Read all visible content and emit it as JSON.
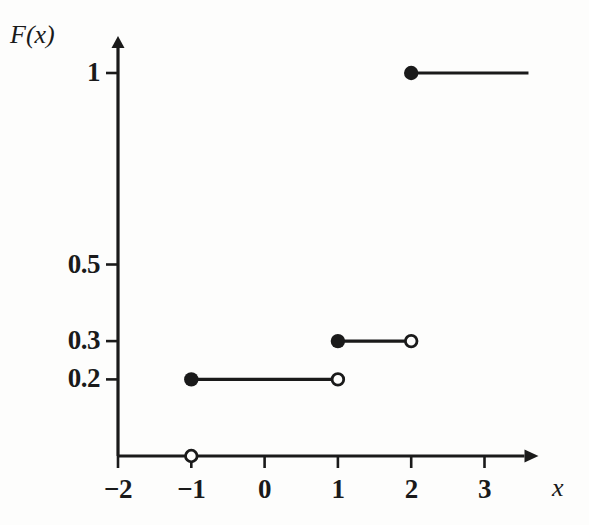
{
  "chart_data": {
    "type": "line",
    "title": "",
    "subtitle": "",
    "xlabel": "x",
    "ylabel": "F(x)",
    "grid": false,
    "legend": "none",
    "xlim": [
      -2,
      3.6
    ],
    "ylim": [
      0,
      1.12
    ],
    "x_ticks": [
      {
        "value": -2,
        "label": "−2"
      },
      {
        "value": -1,
        "label": "−1"
      },
      {
        "value": 0,
        "label": "0"
      },
      {
        "value": 1,
        "label": "1"
      },
      {
        "value": 2,
        "label": "2"
      },
      {
        "value": 3,
        "label": "3"
      }
    ],
    "y_ticks": [
      {
        "value": 0.2,
        "label": "0.2"
      },
      {
        "value": 0.3,
        "label": "0.3"
      },
      {
        "value": 0.5,
        "label": "0.5"
      },
      {
        "value": 1,
        "label": "1"
      }
    ],
    "series": [
      {
        "name": "F(x)",
        "steps": [
          {
            "y": 0,
            "x_start": -1,
            "x_end": -1,
            "start_marker": "open",
            "end_marker": "none",
            "draw_segment": false
          },
          {
            "y": 0.2,
            "x_start": -1,
            "x_end": 1,
            "start_marker": "filled",
            "end_marker": "open",
            "draw_segment": true
          },
          {
            "y": 0.3,
            "x_start": 1,
            "x_end": 2,
            "start_marker": "filled",
            "end_marker": "open",
            "draw_segment": true
          },
          {
            "y": 1,
            "x_start": 2,
            "x_end": 3.6,
            "start_marker": "filled",
            "end_marker": "none",
            "draw_segment": true
          }
        ]
      }
    ],
    "jumps": [
      {
        "x": -1,
        "from": 0,
        "to": 0.2,
        "size": 0.2
      },
      {
        "x": 1,
        "from": 0.2,
        "to": 0.3,
        "size": 0.1
      },
      {
        "x": 2,
        "from": 0.3,
        "to": 1,
        "size": 0.7
      }
    ]
  },
  "axes": {
    "y_axis_name": "F(x)",
    "x_axis_name": "x"
  },
  "style": {
    "ink_color": "#1a1a1a",
    "background_color": "#fdfdfc"
  }
}
